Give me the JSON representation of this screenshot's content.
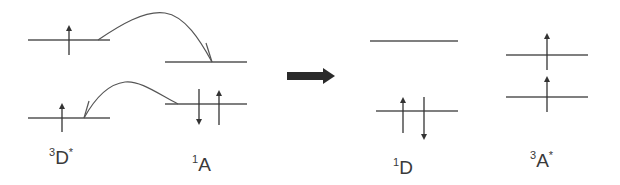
{
  "diagram": {
    "colors": {
      "line": "#555555",
      "arrow": "#333333",
      "background": "#ffffff"
    },
    "left_panel": {
      "donor": {
        "label": {
          "sup": "3",
          "main": "D",
          "star": "*"
        },
        "levels": [
          {
            "name": "LUMO",
            "electrons": [
              "up"
            ]
          },
          {
            "name": "HOMO",
            "electrons": [
              "up"
            ]
          }
        ]
      },
      "acceptor": {
        "label": {
          "sup": "1",
          "main": "A",
          "star": ""
        },
        "levels": [
          {
            "name": "LUMO",
            "electrons": []
          },
          {
            "name": "HOMO",
            "electrons": [
              "down",
              "up"
            ]
          }
        ]
      },
      "transfers": [
        {
          "from": "donor LUMO",
          "to": "acceptor LUMO"
        },
        {
          "from": "acceptor HOMO",
          "to": "donor HOMO"
        }
      ]
    },
    "transition_arrow": "right-arrow",
    "right_panel": {
      "donor": {
        "label": {
          "sup": "1",
          "main": "D",
          "star": ""
        },
        "levels": [
          {
            "name": "LUMO",
            "electrons": []
          },
          {
            "name": "HOMO",
            "electrons": [
              "up",
              "down"
            ]
          }
        ]
      },
      "acceptor": {
        "label": {
          "sup": "3",
          "main": "A",
          "star": "*"
        },
        "levels": [
          {
            "name": "LUMO",
            "electrons": [
              "up"
            ]
          },
          {
            "name": "HOMO",
            "electrons": [
              "up"
            ]
          }
        ]
      }
    }
  }
}
